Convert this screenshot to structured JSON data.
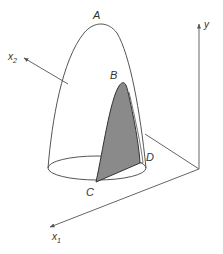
{
  "diagram": {
    "type": "3d-surface-with-cross-section",
    "colors": {
      "line": "#555555",
      "shade": "#8a8a8a",
      "shade_edge": "#333333",
      "background": "#ffffff"
    },
    "points": {
      "A": "A",
      "B": "B",
      "C": "C",
      "D": "D"
    },
    "axes": {
      "x1": {
        "base": "x",
        "sub": "1"
      },
      "x2": {
        "base": "x",
        "sub": "2"
      },
      "y": "y"
    }
  }
}
